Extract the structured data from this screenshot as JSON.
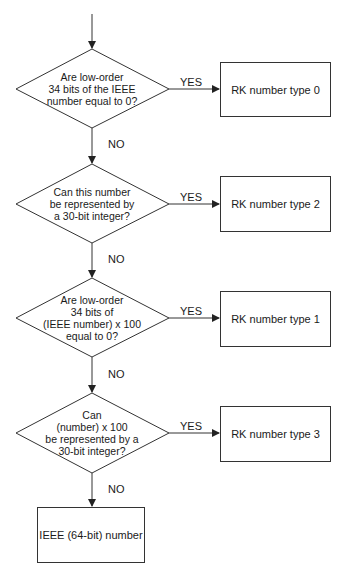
{
  "flowchart": {
    "decisions": [
      {
        "text": [
          "Are low-order",
          "34 bits of the IEEE",
          "number equal to 0?"
        ]
      },
      {
        "text": [
          "Can this number",
          "be represented by",
          "a 30-bit integer?"
        ]
      },
      {
        "text": [
          "Are low-order",
          "34 bits of",
          "(IEEE number) x 100",
          "equal to 0?"
        ]
      },
      {
        "text": [
          "Can",
          "(number) x 100",
          "be represented by a",
          "30-bit integer?"
        ]
      }
    ],
    "outcomes": [
      {
        "label": "RK number type 0"
      },
      {
        "label": "RK number type 2"
      },
      {
        "label": "RK number type 1"
      },
      {
        "label": "RK number type 3"
      }
    ],
    "final": {
      "label": "IEEE (64-bit) number"
    },
    "yes_label": "YES",
    "no_label": "NO",
    "colors": {
      "line": "#333333",
      "text": "#1a1a1a",
      "background": "#ffffff"
    }
  }
}
